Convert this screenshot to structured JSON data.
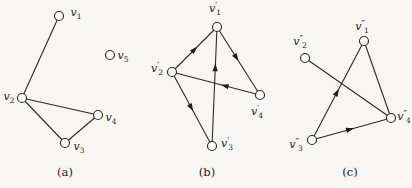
{
  "page": {
    "background": "#f7f6f3",
    "type": "graph-isomorphism-figure"
  },
  "style": {
    "line_color": "#2a2a2a",
    "vertex_fill": "#fdfdfb",
    "vertex_radius": 4.5,
    "arrow_color": "#1c1c1c"
  },
  "figure": {
    "graphs": [
      {
        "id": "a",
        "caption": "(a)",
        "caption_x": 65,
        "caption_y": 172,
        "vertices": [
          {
            "id": "v1",
            "base": "v",
            "primes": "",
            "sub": "1",
            "x": 59,
            "y": 16,
            "lx": 76,
            "ly": 13
          },
          {
            "id": "v5",
            "base": "v",
            "primes": "",
            "sub": "5",
            "x": 110,
            "y": 55,
            "lx": 123,
            "ly": 56
          },
          {
            "id": "v2",
            "base": "v",
            "primes": "",
            "sub": "2",
            "x": 22,
            "y": 98,
            "lx": 9,
            "ly": 97
          },
          {
            "id": "v4",
            "base": "v",
            "primes": "",
            "sub": "4",
            "x": 98,
            "y": 115,
            "lx": 111,
            "ly": 118
          },
          {
            "id": "v3",
            "base": "v",
            "primes": "",
            "sub": "3",
            "x": 65,
            "y": 143,
            "lx": 79,
            "ly": 147
          }
        ],
        "edges": [
          {
            "from": "v1",
            "to": "v2",
            "directed": false
          },
          {
            "from": "v2",
            "to": "v4",
            "directed": false
          },
          {
            "from": "v2",
            "to": "v3",
            "directed": false
          },
          {
            "from": "v3",
            "to": "v4",
            "directed": false
          }
        ]
      },
      {
        "id": "b",
        "caption": "(b)",
        "caption_x": 207,
        "caption_y": 172,
        "vertices": [
          {
            "id": "vp1",
            "base": "v",
            "primes": "′",
            "sub": "1",
            "x": 217,
            "y": 27,
            "lx": 215,
            "ly": 9
          },
          {
            "id": "vp2",
            "base": "v",
            "primes": "′",
            "sub": "2",
            "x": 172,
            "y": 72,
            "lx": 157,
            "ly": 69
          },
          {
            "id": "vp4",
            "base": "v",
            "primes": "′",
            "sub": "4",
            "x": 260,
            "y": 95,
            "lx": 257,
            "ly": 112
          },
          {
            "id": "vp3",
            "base": "v",
            "primes": "′",
            "sub": "3",
            "x": 212,
            "y": 146,
            "lx": 227,
            "ly": 144
          }
        ],
        "edges": [
          {
            "from": "vp2",
            "to": "vp1",
            "directed": true,
            "t": 0.5
          },
          {
            "from": "vp3",
            "to": "vp1",
            "directed": true,
            "t": 0.66
          },
          {
            "from": "vp1",
            "to": "vp4",
            "directed": true,
            "t": 0.45
          },
          {
            "from": "vp4",
            "to": "vp2",
            "directed": true,
            "t": 0.4
          },
          {
            "from": "vp2",
            "to": "vp3",
            "directed": true,
            "t": 0.48
          }
        ]
      },
      {
        "id": "c",
        "caption": "(c)",
        "caption_x": 350,
        "caption_y": 172,
        "vertices": [
          {
            "id": "vpp1",
            "base": "v",
            "primes": "″",
            "sub": "1",
            "x": 364,
            "y": 41,
            "lx": 362,
            "ly": 27
          },
          {
            "id": "vpp2",
            "base": "v",
            "primes": "″",
            "sub": "2",
            "x": 305,
            "y": 58,
            "lx": 300,
            "ly": 42
          },
          {
            "id": "vpp4",
            "base": "v",
            "primes": "″",
            "sub": "4",
            "x": 391,
            "y": 118,
            "lx": 404,
            "ly": 117
          },
          {
            "id": "vpp3",
            "base": "v",
            "primes": "″",
            "sub": "3",
            "x": 312,
            "y": 140,
            "lx": 296,
            "ly": 145
          }
        ],
        "edges": [
          {
            "from": "vpp3",
            "to": "vpp1",
            "directed": true,
            "t": 0.48
          },
          {
            "from": "vpp2",
            "to": "vpp4",
            "directed": false
          },
          {
            "from": "vpp1",
            "to": "vpp4",
            "directed": false
          },
          {
            "from": "vpp3",
            "to": "vpp4",
            "directed": true,
            "t": 0.48
          }
        ]
      }
    ]
  }
}
